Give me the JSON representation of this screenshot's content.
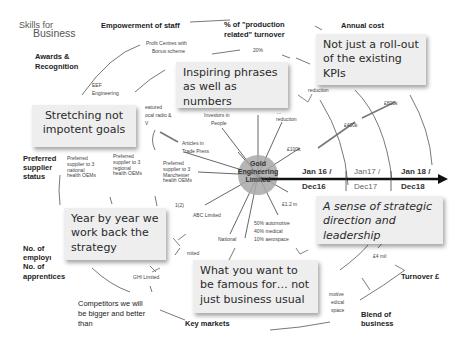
{
  "logo": {
    "line1": "Skills for",
    "line2": "Business"
  },
  "hub": {
    "line1": "Gold",
    "line2": "Engineering",
    "line3": "Limited"
  },
  "categories": {
    "empowerment": "Empowerment of staff",
    "production_line1": "% of \"production",
    "production_line2": "related\" turnover",
    "annual_cost": "Annual cost",
    "awards_line1": "Awards &",
    "awards_line2": "Recognition",
    "preferred_line1": "Preferred",
    "preferred_line2": "supplier",
    "preferred_line3": "status",
    "employees_line1": "No. of",
    "employees_line2": "employı",
    "employees_line3": "No. of",
    "employees_line4": "apprentices",
    "competitors_line1": "Competitors we will",
    "competitors_line2": "be bigger and better",
    "competitors_line3": "than",
    "key_markets": "Key markets",
    "blend_line1": "Blend of",
    "blend_line2": "business",
    "turnover": "Turnover £"
  },
  "small_labels": {
    "profit_centres_line1": "Profit Centres with",
    "profit_centres_line2": "Bonus scheme",
    "pct20": "20%",
    "eef_line1": "EEF",
    "eef_line2": "Engineering",
    "featured_line1": "eatured",
    "featured_line2": "ocal radio &",
    "featured_line3": "V",
    "investors_line1": "Investors in",
    "investors_line2": "People",
    "reduction_top": "reduction",
    "reduction_mid_line1": "...",
    "reduction_mid_line2": "reduction",
    "articles_line1": "Articles in",
    "articles_line2": "Trade Press",
    "k100": "£100k",
    "k400": "£400k",
    "k800": "£800k",
    "pref_national": [
      "Preferred",
      "supplier to 3",
      "national",
      "health OEMs"
    ],
    "pref_regional": [
      "Preferred",
      "supplier to 3",
      "regional",
      "health OEMs"
    ],
    "pref_manchester": [
      "Preferred",
      "supplier to 3",
      "Manchester",
      "health OEMs"
    ],
    "one_two": "1(2)",
    "abc": "ABC Limited",
    "m12": "£1.2 m",
    "national": "National",
    "mix_line1": "50% automotive",
    "mix_line2": "40% medical",
    "mix_line3": "10% aerospace",
    "imited": "mited",
    "ghi": "GHI Limited",
    "m4": "£4 mil",
    "motive_line1": "motive",
    "motive_line2": "edical",
    "motive_line3": "space"
  },
  "timeline": [
    {
      "top": "Jan 16 /",
      "bottom": "Dec16"
    },
    {
      "top": "Jan17 /",
      "bottom": "Dec17"
    },
    {
      "top": "Jan 18 /",
      "bottom": "Dec18"
    }
  ],
  "notes": {
    "roll_out": "Not just a roll-out of the existing KPIs",
    "inspiring": "Inspiring phrases as well as numbers",
    "stretching": "Stretching not impotent goals",
    "year_by_year": "Year by year we work back the strategy",
    "strategic": "A sense of strategic direction and leadership",
    "famous": "What you want to be famous for… not just business usual"
  },
  "colors": {
    "hub_fill": "#a8a8a8",
    "note_bg": "#eeeeee",
    "line": "#333333",
    "arrow": "#111111"
  }
}
